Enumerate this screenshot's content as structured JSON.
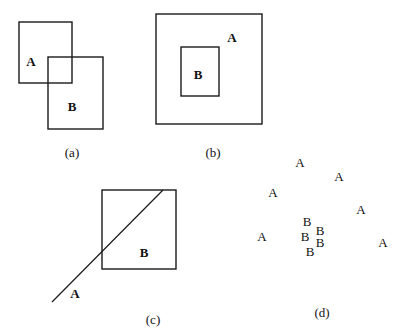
{
  "panels": {
    "a": {
      "caption": "(a)",
      "relation": "overlap",
      "box_a": {
        "label": "A",
        "x": 19,
        "y": 22,
        "w": 53,
        "h": 61
      },
      "box_b": {
        "label": "B",
        "x": 48,
        "y": 57,
        "w": 55,
        "h": 72
      },
      "label_a_pos": [
        31,
        66
      ],
      "label_b_pos": [
        72,
        111
      ],
      "caption_pos": [
        72,
        157
      ]
    },
    "b": {
      "caption": "(b)",
      "relation": "containment",
      "outer": {
        "label": "A",
        "x": 156,
        "y": 14,
        "w": 106,
        "h": 110
      },
      "inner": {
        "label": "B",
        "x": 181,
        "y": 47,
        "w": 38,
        "h": 49
      },
      "label_a_pos": [
        232,
        42
      ],
      "label_b_pos": [
        198,
        79
      ],
      "caption_pos": [
        213,
        157
      ]
    },
    "c": {
      "caption": "(c)",
      "relation": "line crossing region",
      "box_b": {
        "label": "B",
        "x": 102,
        "y": 190,
        "w": 74,
        "h": 79
      },
      "line_a": {
        "label": "A",
        "x1": 52,
        "y1": 302,
        "x2": 163,
        "y2": 190
      },
      "label_a_pos": [
        75,
        298
      ],
      "label_b_pos": [
        144,
        257
      ],
      "caption_pos": [
        153,
        324
      ]
    },
    "d": {
      "caption": "(d)",
      "relation": "point clusters",
      "points_a": [
        {
          "label": "A",
          "x": 300,
          "y": 167
        },
        {
          "label": "A",
          "x": 339,
          "y": 181
        },
        {
          "label": "A",
          "x": 273,
          "y": 197
        },
        {
          "label": "A",
          "x": 361,
          "y": 214
        },
        {
          "label": "A",
          "x": 262,
          "y": 241
        },
        {
          "label": "A",
          "x": 383,
          "y": 247
        }
      ],
      "points_b": [
        {
          "label": "B",
          "x": 307,
          "y": 226
        },
        {
          "label": "B",
          "x": 305,
          "y": 241
        },
        {
          "label": "B",
          "x": 320,
          "y": 235
        },
        {
          "label": "B",
          "x": 320,
          "y": 247
        },
        {
          "label": "B",
          "x": 310,
          "y": 256
        }
      ],
      "caption_pos": [
        322,
        317
      ]
    }
  }
}
